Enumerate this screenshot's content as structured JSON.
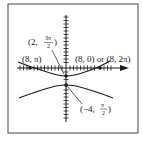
{
  "figure": {
    "type": "polar graph",
    "axes": {
      "x_arrow": true,
      "y_ticks": true,
      "x_ticks": true
    },
    "labels": {
      "point_8_pi": "(8, π)",
      "point_2_3pi2_prefix": "(2,",
      "point_2_3pi2_num": "3π",
      "point_2_3pi2_den": "2",
      "point_8_0": "(8, 0) or (8, 2π)",
      "point_neg4_pi2_prefix": "(−4,",
      "point_neg4_pi2_num": "π",
      "point_neg4_pi2_den": "2"
    },
    "points": [
      {
        "label": "(8, π)",
        "x": 30,
        "y": 68
      },
      {
        "label": "(8, 0) or (8, 2π)",
        "x": 100,
        "y": 68
      },
      {
        "label": "(2, 3π/2)",
        "x": 66,
        "y": 76
      },
      {
        "label": "(−4, π/2)",
        "x": 66,
        "y": 85
      }
    ],
    "colors": {
      "ink": "#1a1a1a",
      "frame": "#444444",
      "background": "#ffffff"
    }
  }
}
